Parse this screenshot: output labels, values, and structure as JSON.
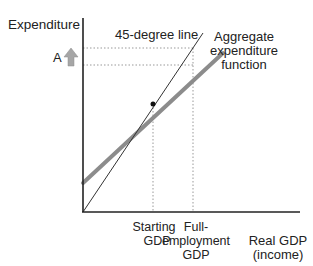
{
  "diagram": {
    "y_axis_label": "Expenditure",
    "x_axis_label_line1": "Real GDP",
    "x_axis_label_line2": "(income)",
    "line_45_label": "45-degree line",
    "ae_label_line1": "Aggregate",
    "ae_label_line2": "expenditure",
    "ae_label_line3": "function",
    "shift_label": "A",
    "starting_gdp_line1": "Starting",
    "starting_gdp_line2": "GDP",
    "full_emp_line1": "Full-",
    "full_emp_line2": "employment",
    "full_emp_line3": "GDP",
    "colors": {
      "axis": "#222222",
      "line_45": "#333333",
      "ae_line": "#8c8c8c",
      "arrow": "#a6a6a6",
      "dotted": "#999999"
    }
  }
}
